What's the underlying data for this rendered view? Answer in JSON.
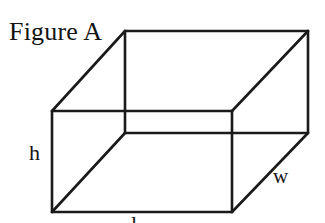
{
  "figure": {
    "title": "Figure A",
    "stroke_color": "#1a1a1a",
    "background_color": "#ffffff",
    "labels": {
      "height": "h",
      "width": "w",
      "length": "l"
    },
    "geometry": {
      "front_face": {
        "top_left": [
          52,
          111
        ],
        "top_right": [
          232,
          111
        ],
        "bottom_right": [
          232,
          212
        ],
        "bottom_left": [
          52,
          212
        ]
      },
      "back_face": {
        "top_left": [
          125,
          31
        ],
        "top_right": [
          308,
          31
        ],
        "bottom_right": [
          308,
          133
        ],
        "bottom_left": [
          125,
          133
        ]
      },
      "connectors": [
        [
          [
            52,
            111
          ],
          [
            125,
            31
          ]
        ],
        [
          [
            232,
            111
          ],
          [
            308,
            31
          ]
        ],
        [
          [
            232,
            212
          ],
          [
            308,
            133
          ]
        ],
        [
          [
            52,
            212
          ],
          [
            125,
            133
          ]
        ]
      ]
    }
  }
}
